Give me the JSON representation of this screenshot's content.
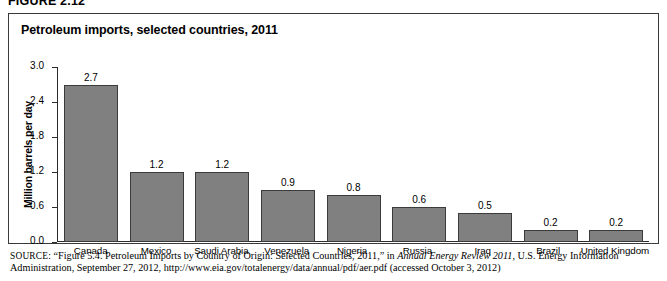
{
  "figure": {
    "label": "FIGURE 2.12",
    "title": "Petroleum imports, selected countries, 2011"
  },
  "chart_data": {
    "type": "bar",
    "title": "Petroleum imports, selected countries, 2011",
    "xlabel": "",
    "ylabel": "Million barrels per day",
    "ylim": [
      0.0,
      3.0
    ],
    "ytick_labels": [
      "3.0",
      "2.4",
      "1.8",
      "1.2",
      "0.6",
      "0.0"
    ],
    "ytick_values": [
      3.0,
      2.4,
      1.8,
      1.2,
      0.6,
      0.0
    ],
    "grid": false,
    "legend": "none",
    "categories": [
      "Canada",
      "Mexico",
      "Saudi Arabia",
      "Venezuela",
      "Nigeria",
      "Russia",
      "Iraq",
      "Brazil",
      "United Kingdom"
    ],
    "values": [
      2.7,
      1.2,
      1.2,
      0.9,
      0.8,
      0.6,
      0.5,
      0.2,
      0.2
    ],
    "data_labels": [
      "2.7",
      "1.2",
      "1.2",
      "0.9",
      "0.8",
      "0.6",
      "0.5",
      "0.2",
      "0.2"
    ],
    "bar_color": "#808080",
    "bar_border_color": "#3b3b3b"
  },
  "source": {
    "prefix": "SOURCE:",
    "text_before_italic": " “Figure 5.4. Petroleum Imports by Country of Origin: Selected Countries, 2011,” in ",
    "italic_title": "Annual Energy Review 2011",
    "text_after_italic": ", U.S. Energy Information Administration, September 27, 2012, http://www.eia.gov/totalenergy/data/annual/pdf/aer.pdf (accessed October 3, 2012)"
  }
}
